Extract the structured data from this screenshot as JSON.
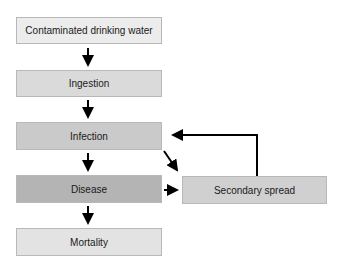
{
  "diagram": {
    "type": "flowchart",
    "nodes": [
      {
        "id": "water",
        "label": "Contaminated drinking water",
        "fill": "#ececec"
      },
      {
        "id": "ingestion",
        "label": "Ingestion",
        "fill": "#dadada"
      },
      {
        "id": "infection",
        "label": "Infection",
        "fill": "#cacaca"
      },
      {
        "id": "disease",
        "label": "Disease",
        "fill": "#b4b4b4"
      },
      {
        "id": "mortality",
        "label": "Mortality",
        "fill": "#e3e3e3"
      },
      {
        "id": "secondary",
        "label": "Secondary spread",
        "fill": "#d0d0d0"
      }
    ],
    "edges": [
      {
        "from": "water",
        "to": "ingestion"
      },
      {
        "from": "ingestion",
        "to": "infection"
      },
      {
        "from": "infection",
        "to": "disease"
      },
      {
        "from": "disease",
        "to": "mortality"
      },
      {
        "from": "infection",
        "to": "secondary"
      },
      {
        "from": "disease",
        "to": "secondary"
      },
      {
        "from": "secondary",
        "to": "infection"
      }
    ],
    "arrow_color": "#000000"
  }
}
